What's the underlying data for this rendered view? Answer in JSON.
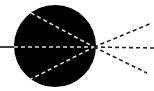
{
  "diagram": {
    "colors": {
      "background": "#ffffff",
      "sphere": "#000000",
      "inner_dash": "#dcdcdc",
      "outer_dash": "#222222",
      "incoming_line": "#000000"
    },
    "sphere": {
      "cx": 55,
      "cy": 46,
      "r": 41
    },
    "focal_point": {
      "x": 94,
      "y": 47
    },
    "incoming_line": {
      "x1": 0,
      "y1": 47,
      "x2": 14,
      "y2": 47
    },
    "inner_rays": [
      {
        "x1": 31,
        "y1": 13,
        "x2": 94,
        "y2": 47
      },
      {
        "x1": 14,
        "y1": 47,
        "x2": 94,
        "y2": 47
      },
      {
        "x1": 29,
        "y1": 80,
        "x2": 94,
        "y2": 47
      }
    ],
    "outer_rays": [
      {
        "x1": 94,
        "y1": 47,
        "x2": 152,
        "y2": 23
      },
      {
        "x1": 94,
        "y1": 47,
        "x2": 154,
        "y2": 48
      },
      {
        "x1": 94,
        "y1": 47,
        "x2": 147,
        "y2": 73
      }
    ]
  }
}
